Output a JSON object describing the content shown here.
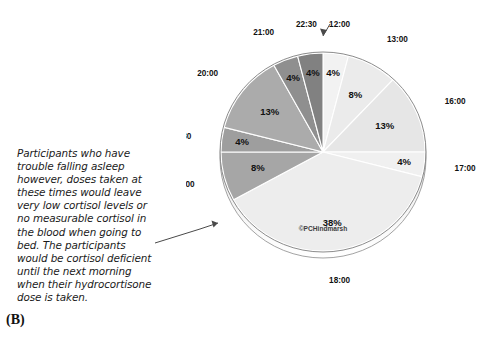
{
  "panel": {
    "label": "(B)"
  },
  "annotation": {
    "lines": [
      "Participants who have",
      "trouble falling asleep",
      "however, doses taken at",
      "these times would leave",
      "very low cortisol levels or",
      "no measurable cortisol in",
      "the blood when going to",
      "bed. The participants",
      "would be cortisol deficient",
      "until the next morning",
      "when their hydrocortisone",
      "dose is taken."
    ]
  },
  "chart_data": {
    "type": "pie",
    "title": "",
    "watermark": "©PCHindmarsh",
    "categories": [
      "12:00",
      "13:00",
      "16:00",
      "17:00",
      "18:00",
      "19:00",
      "19:30",
      "20:00",
      "21:00",
      "22:30"
    ],
    "values": [
      4,
      8,
      13,
      4,
      38,
      8,
      4,
      13,
      4,
      4
    ],
    "value_labels": [
      "4%",
      "8%",
      "13%",
      "4%",
      "38%",
      "8%",
      "4%",
      "13%",
      "4%",
      "4%"
    ],
    "colors": [
      "#f2f2f2",
      "#ebebeb",
      "#e6e6e6",
      "#f0f0f0",
      "#ededed",
      "#a6a6a6",
      "#9e9e9e",
      "#ababab",
      "#8f8f8f",
      "#818181"
    ],
    "start_angle_deg": 0,
    "direction": "clockwise",
    "legend": "none",
    "grid": false
  },
  "colors": {
    "light_slice": "#ededed",
    "dark_slice": "#a6a6a6",
    "outline": "#8c8c8c",
    "text": "#111111"
  }
}
